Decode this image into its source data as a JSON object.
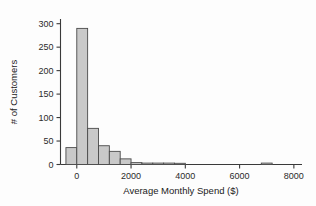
{
  "chart_data": {
    "type": "bar",
    "title": "",
    "subtitle": "",
    "xlabel": "Average Monthly Spend ($)",
    "ylabel": "# of Customers",
    "xlim": [
      -600,
      8300
    ],
    "ylim": [
      0,
      310
    ],
    "grid": false,
    "legend": null,
    "bin_width": 400,
    "xticks": [
      0,
      2000,
      4000,
      6000,
      8000
    ],
    "xtick_labels": [
      "0",
      "2000",
      "4000",
      "6000",
      "8000"
    ],
    "yticks": [
      0,
      50,
      100,
      150,
      200,
      250,
      300
    ],
    "ytick_labels": [
      "0",
      "50",
      "100",
      "150",
      "200",
      "250",
      "300"
    ],
    "categories": [
      "-400 to 0",
      "0 to 400",
      "400 to 800",
      "800 to 1200",
      "1200 to 1600",
      "1600 to 2000",
      "2000 to 2400",
      "2400 to 2800",
      "2800 to 3200",
      "3200 to 3600",
      "3600 to 4000",
      "6800 to 7200"
    ],
    "bins": [
      {
        "left": -400,
        "right": 0,
        "value": 36
      },
      {
        "left": 0,
        "right": 400,
        "value": 290
      },
      {
        "left": 400,
        "right": 800,
        "value": 77
      },
      {
        "left": 800,
        "right": 1200,
        "value": 40
      },
      {
        "left": 1200,
        "right": 1600,
        "value": 28
      },
      {
        "left": 1600,
        "right": 2000,
        "value": 12
      },
      {
        "left": 2000,
        "right": 2400,
        "value": 4
      },
      {
        "left": 2400,
        "right": 2800,
        "value": 3
      },
      {
        "left": 2800,
        "right": 3200,
        "value": 3
      },
      {
        "left": 3200,
        "right": 3600,
        "value": 3
      },
      {
        "left": 3600,
        "right": 4000,
        "value": 1
      },
      {
        "left": 6800,
        "right": 7200,
        "value": 3
      }
    ],
    "values": [
      36,
      290,
      77,
      40,
      28,
      12,
      4,
      3,
      3,
      3,
      1,
      3
    ],
    "colors": {
      "bar_fill": "#c9c9c9",
      "bar_stroke": "#4a4a4a",
      "axis": "#3a3a3a",
      "text": "#2b2b2b",
      "background": "#fdfdfd"
    }
  }
}
